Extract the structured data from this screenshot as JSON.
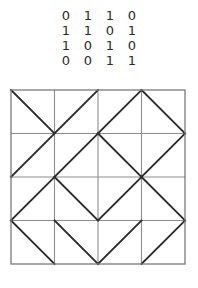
{
  "matrix": {
    "name": "binary-matrix",
    "rows": [
      [
        "0",
        "1",
        "1",
        "0"
      ],
      [
        "1",
        "1",
        "0",
        "1"
      ],
      [
        "1",
        "0",
        "1",
        "0"
      ],
      [
        "0",
        "0",
        "1",
        "1"
      ]
    ]
  },
  "diagram": {
    "name": "diagonal-tile-grid",
    "rows": 4,
    "cols": 4,
    "cell_size": 43.5,
    "origin_x": 2,
    "origin_y": 2,
    "bits": [
      [
        0,
        1,
        1,
        0
      ],
      [
        1,
        1,
        0,
        1
      ],
      [
        1,
        0,
        1,
        0
      ],
      [
        0,
        0,
        1,
        1
      ]
    ],
    "legend": {
      "zero_direction": "backslash",
      "one_direction": "slash"
    },
    "colors": {
      "grid": "#8d8d8d",
      "border": "#7a7a7a",
      "diagonal": "#2c2c2c",
      "background": "#ffffff",
      "text": "#2b2b2b"
    }
  }
}
